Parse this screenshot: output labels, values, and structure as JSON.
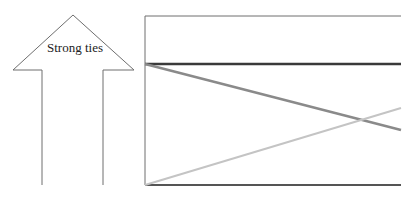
{
  "arrow": {
    "label": "Strong ties",
    "stroke_color": "#6e6e6e"
  },
  "diagram": {
    "frame_color": "#6e6e6e",
    "lines": [
      {
        "name": "dark-horizontal-line",
        "color": "#3a3a3a",
        "from": [
          145,
          64
        ],
        "to": [
          401,
          64
        ]
      },
      {
        "name": "mid-gray-descending-line",
        "color": "#8a8a8a",
        "from": [
          145,
          64
        ],
        "to": [
          401,
          130
        ]
      },
      {
        "name": "light-gray-ascending-line",
        "color": "#c4c4c4",
        "from": [
          145,
          185
        ],
        "to": [
          401,
          108
        ]
      }
    ]
  }
}
